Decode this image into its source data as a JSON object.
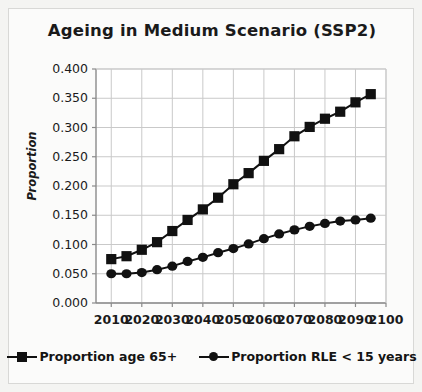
{
  "chart_data": {
    "type": "line",
    "title": "Ageing in Medium Scenario (SSP2)",
    "xlabel": "",
    "ylabel": "Proportion",
    "x": [
      2010,
      2015,
      2020,
      2025,
      2030,
      2035,
      2040,
      2045,
      2050,
      2055,
      2060,
      2065,
      2070,
      2075,
      2080,
      2085,
      2090,
      2095
    ],
    "xlim": [
      2005,
      2100
    ],
    "ylim": [
      0.0,
      0.4
    ],
    "xticks": [
      2010,
      2020,
      2030,
      2040,
      2050,
      2060,
      2070,
      2080,
      2090,
      2100
    ],
    "xtick_labels": [
      "2010",
      "2020",
      "2030",
      "2040",
      "2050",
      "2060",
      "2070",
      "2080",
      "2090",
      "2100"
    ],
    "yticks": [
      0.0,
      0.05,
      0.1,
      0.15,
      0.2,
      0.25,
      0.3,
      0.35,
      0.4
    ],
    "ytick_labels": [
      "0.000",
      "0.050",
      "0.100",
      "0.150",
      "0.200",
      "0.250",
      "0.300",
      "0.350",
      "0.400"
    ],
    "grid": true,
    "legend_position": "bottom",
    "series": [
      {
        "name": "Proportion age 65+",
        "marker": "square",
        "color": "#111111",
        "values": [
          0.075,
          0.08,
          0.091,
          0.104,
          0.123,
          0.142,
          0.16,
          0.18,
          0.203,
          0.222,
          0.243,
          0.263,
          0.285,
          0.301,
          0.315,
          0.327,
          0.343,
          0.357
        ]
      },
      {
        "name": "Proportion RLE < 15 years",
        "marker": "diamond",
        "color": "#111111",
        "values": [
          0.05,
          0.05,
          0.052,
          0.057,
          0.063,
          0.071,
          0.078,
          0.086,
          0.093,
          0.101,
          0.11,
          0.118,
          0.125,
          0.131,
          0.136,
          0.14,
          0.142,
          0.145
        ]
      }
    ]
  },
  "legend": {
    "entries": [
      {
        "label": "Proportion age 65+",
        "marker": "square"
      },
      {
        "label": "Proportion RLE < 15 years",
        "marker": "diamond"
      }
    ]
  },
  "colors": {
    "series": "#111111",
    "grid": "#c9c9c9",
    "axis": "#8a8a8a",
    "text": "#1a1a1a",
    "plot_background": "#ffffff",
    "card_background": "#fbfbfa",
    "page_background": "#f2f2f0"
  }
}
